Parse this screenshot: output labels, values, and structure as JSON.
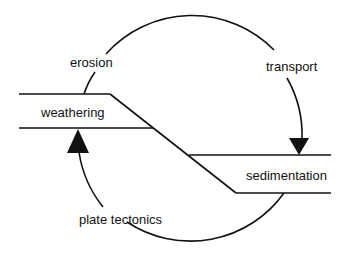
{
  "diagram": {
    "type": "rock cycle",
    "labels": {
      "erosion": "erosion",
      "transport": "transport",
      "weathering": "weathering",
      "sedimentation": "sedimentation",
      "plate_tectonics": "plate tectonics"
    },
    "colors": {
      "stroke": "#111111",
      "background": "#ffffff"
    }
  }
}
